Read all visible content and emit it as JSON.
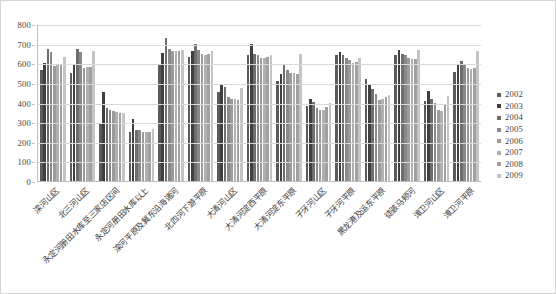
{
  "chart_data": {
    "type": "bar",
    "title": "",
    "subtitle": "",
    "xlabel": "",
    "ylabel": "",
    "ylim": [
      0,
      800
    ],
    "ytick_step": 100,
    "yticks": [
      "800",
      "700",
      "600",
      "500",
      "400",
      "300",
      "200",
      "100",
      "0"
    ],
    "grid": true,
    "legend_position": "right",
    "orientation": "vertical",
    "categories": [
      "滦河山区",
      "北三河山区",
      "永定河册田水库至三家店区间",
      "永定河册田水库以上",
      "滦河平原及冀东沿海诸河",
      "北四河下游平原",
      "大清河山区",
      "大清河淀西平原",
      "大清河淀东平原",
      "子牙河山区",
      "子牙河平原",
      "黑龙港及运东平原",
      "徒骇马颊河",
      "漳卫河山区",
      "漳卫河平原"
    ],
    "series": [
      {
        "name": "2002",
        "color": "#5a5a5a",
        "values": [
          565,
          548,
          292,
          250,
          598,
          633,
          455,
          640,
          510,
          382,
          640,
          520,
          640,
          408,
          555
        ]
      },
      {
        "name": "2003",
        "color": "#3f3f3f",
        "values": [
          600,
          590,
          455,
          318,
          650,
          665,
          490,
          700,
          545,
          418,
          658,
          490,
          668,
          460,
          590
        ]
      },
      {
        "name": "2004",
        "color": "#6e6e6e",
        "values": [
          672,
          672,
          373,
          260,
          730,
          700,
          480,
          645,
          590,
          403,
          640,
          470,
          648,
          420,
          610
        ]
      },
      {
        "name": "2005",
        "color": "#8a8a8a",
        "values": [
          655,
          655,
          360,
          258,
          672,
          668,
          430,
          640,
          565,
          372,
          628,
          443,
          640,
          400,
          598
        ]
      },
      {
        "name": "2006",
        "color": "#9b9b9b",
        "values": [
          588,
          578,
          358,
          250,
          660,
          648,
          420,
          628,
          552,
          360,
          618,
          415,
          628,
          360,
          575
        ]
      },
      {
        "name": "2007",
        "color": "#b0b0b0",
        "values": [
          592,
          582,
          352,
          252,
          660,
          642,
          418,
          628,
          548,
          362,
          600,
          420,
          620,
          355,
          572
        ]
      },
      {
        "name": "2008",
        "color": "#a0a0a0",
        "values": [
          590,
          580,
          348,
          250,
          662,
          645,
          415,
          630,
          545,
          375,
          608,
          430,
          622,
          390,
          578
        ]
      },
      {
        "name": "2009",
        "color": "#c4c4c4",
        "values": [
          630,
          660,
          345,
          265,
          668,
          662,
          472,
          640,
          645,
          398,
          628,
          438,
          670,
          432,
          662
        ]
      }
    ]
  },
  "legend": {
    "items": [
      "2002",
      "2003",
      "2004",
      "2005",
      "2006",
      "2007",
      "2008",
      "2009"
    ]
  }
}
